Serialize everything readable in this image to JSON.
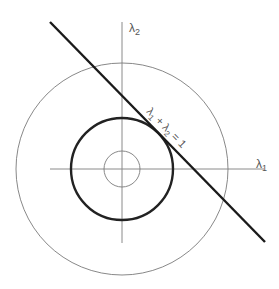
{
  "figure": {
    "type": "geometric-diagram",
    "colors": {
      "background": "#ffffff",
      "axis": "#8a8a8a",
      "thin_circle": "#7a7a7a",
      "thick_circle": "#222222",
      "line": "#1a1a1a",
      "label": "#555555"
    },
    "origin": {
      "x": 122,
      "y": 169
    },
    "axes": {
      "x_label_base": "λ",
      "x_label_sub": "1",
      "y_label_base": "λ",
      "y_label_sub": "2"
    },
    "circles": [
      {
        "name": "inner-circle",
        "radius": 18,
        "weight": "thin"
      },
      {
        "name": "tangent-circle",
        "radius": 51,
        "weight": "thick"
      },
      {
        "name": "outer-circle",
        "radius": 106,
        "weight": "thin"
      }
    ],
    "line": {
      "from": {
        "x": 50,
        "y": 22
      },
      "to": {
        "x": 265,
        "y": 242
      },
      "label": {
        "l1": "λ",
        "s1": "1",
        "plus": " + ",
        "l2": "λ",
        "s2": "2",
        "eq": " = 1"
      }
    }
  }
}
